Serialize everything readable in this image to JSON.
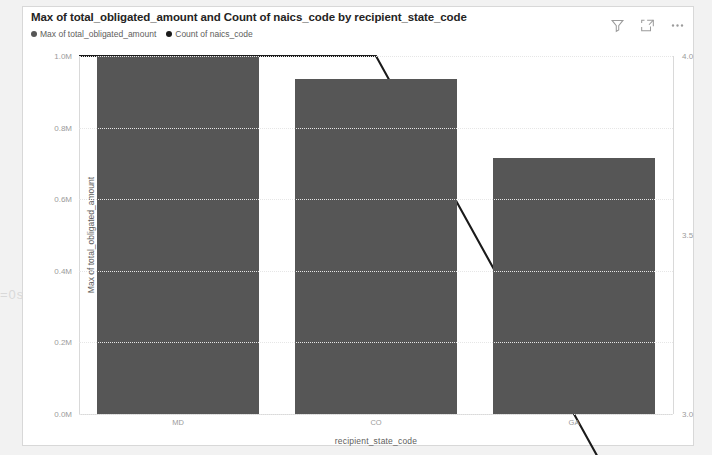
{
  "visual": {
    "title": "Max of total_obligated_amount and Count of naics_code by recipient_state_code",
    "bar_color": "#565656",
    "line_color": "#1a1a1a",
    "card_background": "#ffffff",
    "page_background": "#f2f2f2"
  },
  "header_icons": [
    {
      "name": "filter-icon",
      "label": "Filters"
    },
    {
      "name": "focus-mode-icon",
      "label": "Focus mode"
    },
    {
      "name": "more-options-icon",
      "label": "More options"
    }
  ],
  "legend": [
    {
      "label": "Max of total_obligated_amount",
      "color": "#565656"
    },
    {
      "label": "Count of naics_code",
      "color": "#1a1a1a"
    }
  ],
  "background_artifact": "=0s:",
  "chart_data": {
    "type": "bar",
    "title": "Max of total_obligated_amount and Count of naics_code by recipient_state_code",
    "xlabel": "recipient_state_code",
    "ylabel": "Max of total_obligated_amount",
    "y2label": "Count of naics_code",
    "categories": [
      "MD",
      "CO",
      "GA"
    ],
    "grid": true,
    "legend_position": "top-left",
    "series": [
      {
        "name": "Max of total_obligated_amount",
        "type": "bar",
        "axis": "left",
        "color": "#565656",
        "values": [
          1000000,
          935000,
          715000
        ]
      },
      {
        "name": "Count of naics_code",
        "type": "line",
        "axis": "right",
        "color": "#1a1a1a",
        "values": [
          4.0,
          4.0,
          3.0
        ]
      }
    ],
    "ylim": [
      0,
      1000000
    ],
    "y2lim": [
      3.0,
      4.0
    ],
    "yticks": [
      {
        "value": 0,
        "label": "0.0M"
      },
      {
        "value": 200000,
        "label": "0.2M"
      },
      {
        "value": 400000,
        "label": "0.4M"
      },
      {
        "value": 600000,
        "label": "0.6M"
      },
      {
        "value": 800000,
        "label": "0.8M"
      },
      {
        "value": 1000000,
        "label": "1.0M"
      }
    ],
    "y2ticks": [
      {
        "value": 3.0,
        "label": "3.0"
      },
      {
        "value": 3.5,
        "label": "3.5"
      },
      {
        "value": 4.0,
        "label": "4.0"
      }
    ]
  }
}
